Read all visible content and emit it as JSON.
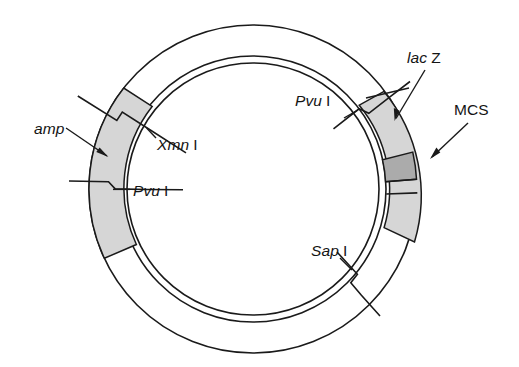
{
  "figure": {
    "type": "plasmid-map",
    "title": "",
    "background_color": "#ffffff",
    "line_color": "#1a1a1a"
  },
  "labels": {
    "amp": {
      "text": "amp",
      "style": "italic"
    },
    "xmn_i": {
      "gene": "Xmn",
      "enzyme_number": "I"
    },
    "pvu_i_left": {
      "gene": "Pvu",
      "enzyme_number": "I"
    },
    "pvu_i_right": {
      "gene": "Pvu",
      "enzyme_number": "I"
    },
    "lac_z": {
      "gene": "lac",
      "suffix": "Z"
    },
    "mcs": {
      "text": "MCS"
    },
    "sap_i": {
      "gene": "Sap",
      "enzyme_number": "I"
    }
  },
  "regions": [
    {
      "id": "amp",
      "label": "amp",
      "fill": "#d5d5d5",
      "start_angle_deg": 142,
      "end_angle_deg": 205
    },
    {
      "id": "lacZ",
      "label": "lac Z",
      "fill": "#d5d5d5",
      "start_angle_deg": 323,
      "end_angle_deg": 39
    },
    {
      "id": "MCS",
      "label": "MCS",
      "fill": "#a9a9a9",
      "start_angle_deg": 13,
      "end_angle_deg": 20
    }
  ],
  "sites": [
    {
      "id": "xmn-i",
      "label": "Xmn I",
      "angle_deg": 132
    },
    {
      "id": "pvu-i-left",
      "label": "Pvu I",
      "angle_deg": 182
    },
    {
      "id": "pvu-i-right",
      "label": "Pvu I",
      "angle_deg": 52
    },
    {
      "id": "sap-i",
      "label": "Sap I",
      "angle_deg": 305
    }
  ],
  "geometry": {
    "center_x": 253,
    "center_y": 189,
    "outer_radius": 164,
    "inner_radius": 133,
    "core_radius": 126
  }
}
